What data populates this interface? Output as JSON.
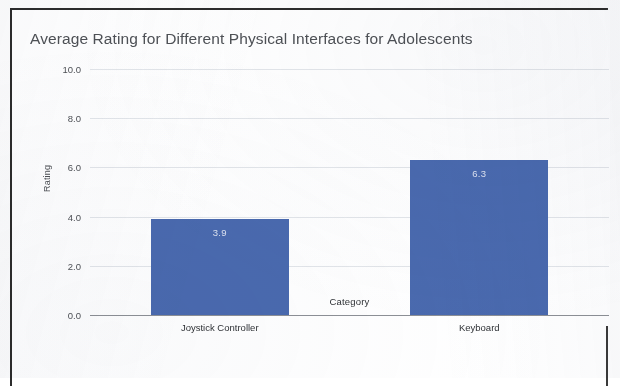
{
  "figure": {
    "frame_color": "#2c2c2c",
    "background": "#ffffff"
  },
  "chart_data": {
    "type": "bar",
    "title": "Average Rating for Different Physical Interfaces for Adolescents",
    "xlabel": "Category",
    "ylabel": "Rating",
    "categories": [
      "Joystick Controller",
      "Keyboard"
    ],
    "values": [
      3.9,
      6.3
    ],
    "value_labels": [
      "3.9",
      "6.3"
    ],
    "ylim": [
      0.0,
      10.0
    ],
    "yticks": [
      10.0,
      8.0,
      6.0,
      4.0,
      2.0,
      0.0
    ],
    "ytick_labels": [
      "10.0",
      "8.0",
      "6.0",
      "4.0",
      "2.0",
      "0.0"
    ],
    "grid": true,
    "legend": null,
    "legend_position": "none",
    "bar_color": "#4a6aaf",
    "value_label_color": "#e9edf6",
    "gridline_color": "#e3e6ea",
    "axis_color": "#8d9096",
    "title_color": "#4e5156"
  }
}
